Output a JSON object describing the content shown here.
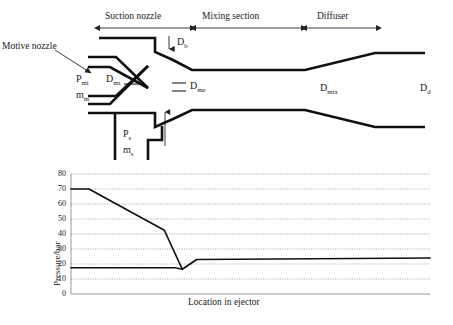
{
  "figure": {
    "diagram": {
      "section_labels": [
        {
          "text": "Suction nozzle",
          "x": 100,
          "x2": 190
        },
        {
          "text": "Mixing section",
          "x": 196,
          "x2": 301
        },
        {
          "text": "Diffuser",
          "x": 307,
          "x2": 376
        }
      ],
      "callouts": [
        {
          "name": "motive-nozzle",
          "text": "Motive nozzle"
        }
      ],
      "dimension_labels": [
        {
          "name": "Db",
          "base": "D",
          "sub": "b"
        },
        {
          "name": "Pmi",
          "base": "P",
          "sub": "mi"
        },
        {
          "name": "mm",
          "base": "m",
          "sub": "m"
        },
        {
          "name": "Dmt",
          "base": "D",
          "sub": "mt"
        },
        {
          "name": "Dme",
          "base": "D",
          "sub": "me"
        },
        {
          "name": "Ps",
          "base": "P",
          "sub": "s"
        },
        {
          "name": "ms",
          "base": "m",
          "sub": "s"
        },
        {
          "name": "Dmix",
          "base": "D",
          "sub": "mix"
        },
        {
          "name": "Dd",
          "base": "D",
          "sub": "d"
        }
      ]
    }
  },
  "chart_data": {
    "type": "line",
    "title": "",
    "xlabel": "Location in ejector",
    "ylabel": "Pressure/bar",
    "ylim": [
      0,
      80
    ],
    "ytick_step": 10,
    "yticks": [
      80,
      70,
      60,
      50,
      40,
      30,
      20,
      10,
      0
    ],
    "grid": "horizontal-dotted",
    "legend": "none",
    "xticks": [],
    "series": [
      {
        "name": "motive-stream-pressure",
        "points": [
          {
            "x": 0.0,
            "y": 70.0
          },
          {
            "x": 0.05,
            "y": 70.0
          },
          {
            "x": 0.26,
            "y": 42.5
          },
          {
            "x": 0.31,
            "y": 16.5
          }
        ]
      },
      {
        "name": "suction-stream-pressure",
        "points": [
          {
            "x": 0.0,
            "y": 17.5
          },
          {
            "x": 0.29,
            "y": 17.5
          },
          {
            "x": 0.31,
            "y": 16.5
          },
          {
            "x": 0.35,
            "y": 23.0
          },
          {
            "x": 1.0,
            "y": 24.0
          }
        ]
      }
    ]
  }
}
